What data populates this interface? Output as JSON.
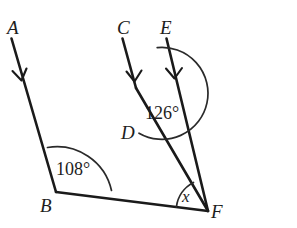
{
  "figure": {
    "type": "geometry-diagram",
    "background_color": "#ffffff",
    "line_color": "#1a1a1a",
    "arc_color": "#2a2a2a",
    "width": 297,
    "height": 228
  },
  "points": [
    {
      "id": "A",
      "label": "A",
      "x": 12,
      "y": 27,
      "label_x": 7,
      "label_y": 18
    },
    {
      "id": "B",
      "label": "B",
      "x": 56,
      "y": 192,
      "label_x": 40,
      "label_y": 196
    },
    {
      "id": "C",
      "label": "C",
      "x": 123,
      "y": 27,
      "label_x": 117,
      "label_y": 18
    },
    {
      "id": "D",
      "label": "D",
      "x": 136,
      "y": 88,
      "label_x": 121,
      "label_y": 123
    },
    {
      "id": "E",
      "label": "E",
      "x": 167,
      "y": 27,
      "label_x": 160,
      "label_y": 18
    },
    {
      "id": "F",
      "label": "F",
      "x": 208,
      "y": 211,
      "label_x": 211,
      "label_y": 202
    }
  ],
  "segments": [
    {
      "id": "BA",
      "from": "B",
      "to": "A",
      "arrow": true,
      "arrow_t": 0.72
    },
    {
      "id": "DC",
      "from": "D",
      "to": "C",
      "arrow": true,
      "arrow_t": 0.82
    },
    {
      "id": "FE",
      "from": "F",
      "to": "E",
      "arrow": true,
      "arrow_t": 0.79
    },
    {
      "id": "BF",
      "from": "B",
      "to": "F",
      "arrow": false,
      "arrow_t": 0
    },
    {
      "id": "DF",
      "from": "D",
      "to": "F",
      "arrow": false,
      "arrow_t": 0
    }
  ],
  "angles": [
    {
      "id": "angle-B",
      "vertex": "B",
      "value": "108°",
      "label_x": 56,
      "label_y": 160,
      "radius": 56,
      "from_ray": "BA",
      "to_ray": "BF"
    },
    {
      "id": "angle-D",
      "vertex": "D",
      "value": "126°",
      "label_x": 145,
      "label_y": 104,
      "radius": 46,
      "from_ray": "DC",
      "to_ray": "DF"
    },
    {
      "id": "angle-F",
      "vertex": "F",
      "value": "x",
      "label_x": 182,
      "label_y": 188,
      "radius": 32,
      "from_ray": "FB",
      "to_ray": "FD"
    }
  ],
  "arcs": [
    {
      "id": "arc-108",
      "d": "M 47.5 147.5 A 56 56 0 0 1 111.5 190.5"
    },
    {
      "id": "arc-126",
      "d": "M 139 133.2 A 46 46 0 1 0 157.2 47.6"
    },
    {
      "id": "arc-x",
      "d": "M 176.4 207.0 A 32 32 0 0 1 193.5 182.4"
    }
  ],
  "arrowheads": [
    {
      "id": "arrow-BA",
      "d": "M 12.5 71 L 21.5 80.5 L 26.5 68.5"
    },
    {
      "id": "arrow-DC",
      "d": "M 126.5 71.5 L 134.5 81.5 L 141.5 70.5"
    },
    {
      "id": "arrow-FE",
      "d": "M 166.0 68.5 L 174.5 78.5 L 182.0 68.0"
    }
  ]
}
